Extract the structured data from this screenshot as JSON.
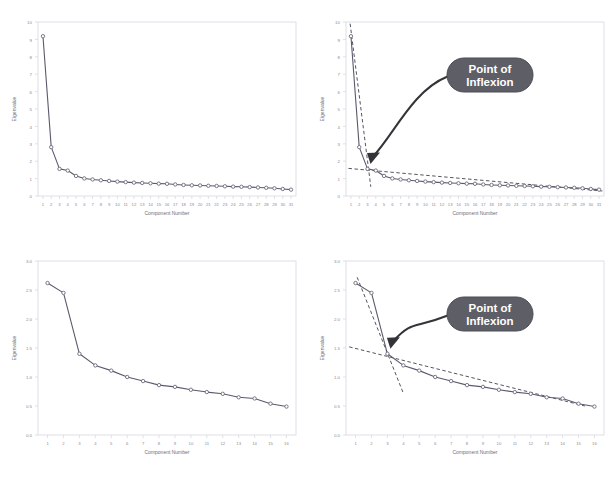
{
  "figure": {
    "kind": "scree-plot-figure",
    "panel_count": 4,
    "background_color": "#ffffff",
    "line_color": "#5a5a6e",
    "marker_color": "#6b6b7d",
    "frame_color": "#d8d8e0",
    "tick_label_color": "#8a8a96",
    "axis_title_color": "#6e6e7a",
    "dashed_line_color": "#555560",
    "callout_fill": "#5e5e66",
    "callout_text_color": "#ffffff",
    "arrow_color": "#333338"
  },
  "callout": {
    "line1": "Point of",
    "line2": "Inflexion",
    "full_text": "Point of Inflexion"
  },
  "chart_data": [
    {
      "id": "top-left",
      "type": "line",
      "title": "",
      "xlabel": "Component Number",
      "ylabel": "Eigenvalue",
      "xlim": [
        0.4,
        31.6
      ],
      "ylim": [
        0,
        10.4
      ],
      "grid": false,
      "legend": "none",
      "annotations": [],
      "x_tick_labels": [
        "1",
        "2",
        "3",
        "4",
        "5",
        "6",
        "7",
        "8",
        "9",
        "10",
        "11",
        "12",
        "13",
        "14",
        "15",
        "16",
        "17",
        "18",
        "19",
        "20",
        "21",
        "22",
        "23",
        "24",
        "25",
        "26",
        "27",
        "28",
        "29",
        "30",
        "31"
      ],
      "y_tick_labels": [
        "0",
        "1",
        "2",
        "3",
        "4",
        "5",
        "6",
        "7",
        "8",
        "9",
        "10"
      ],
      "categories": [
        1,
        2,
        3,
        4,
        5,
        6,
        7,
        8,
        9,
        10,
        11,
        12,
        13,
        14,
        15,
        16,
        17,
        18,
        19,
        20,
        21,
        22,
        23,
        24,
        25,
        26,
        27,
        28,
        29,
        30,
        31
      ],
      "values": [
        9.55,
        2.92,
        1.62,
        1.52,
        1.2,
        1.05,
        0.99,
        0.94,
        0.9,
        0.86,
        0.83,
        0.8,
        0.78,
        0.76,
        0.74,
        0.73,
        0.69,
        0.66,
        0.64,
        0.63,
        0.61,
        0.6,
        0.58,
        0.56,
        0.55,
        0.53,
        0.51,
        0.49,
        0.46,
        0.42,
        0.38
      ]
    },
    {
      "id": "top-right",
      "type": "line",
      "title": "",
      "xlabel": "Component Number",
      "ylabel": "Eigenvalue",
      "xlim": [
        0.4,
        31.6
      ],
      "ylim": [
        0,
        10.4
      ],
      "grid": false,
      "legend": "none",
      "x_tick_labels": [
        "1",
        "2",
        "3",
        "4",
        "5",
        "6",
        "7",
        "8",
        "9",
        "10",
        "11",
        "12",
        "13",
        "14",
        "15",
        "16",
        "17",
        "18",
        "19",
        "20",
        "21",
        "22",
        "23",
        "24",
        "25",
        "26",
        "27",
        "28",
        "29",
        "30",
        "31"
      ],
      "y_tick_labels": [
        "0",
        "1",
        "2",
        "3",
        "4",
        "5",
        "6",
        "7",
        "8",
        "9",
        "10"
      ],
      "categories": [
        1,
        2,
        3,
        4,
        5,
        6,
        7,
        8,
        9,
        10,
        11,
        12,
        13,
        14,
        15,
        16,
        17,
        18,
        19,
        20,
        21,
        22,
        23,
        24,
        25,
        26,
        27,
        28,
        29,
        30,
        31
      ],
      "values": [
        9.55,
        2.92,
        1.62,
        1.52,
        1.2,
        1.05,
        0.99,
        0.94,
        0.9,
        0.86,
        0.83,
        0.8,
        0.78,
        0.76,
        0.74,
        0.73,
        0.69,
        0.66,
        0.64,
        0.63,
        0.61,
        0.6,
        0.58,
        0.56,
        0.55,
        0.53,
        0.51,
        0.49,
        0.46,
        0.42,
        0.38
      ],
      "annotations": [
        {
          "kind": "callout",
          "text": "Point of Inflexion",
          "points_to_component": 3
        },
        {
          "kind": "dashed-trend-steep",
          "from": [
            0.9,
            10.3
          ],
          "to": [
            3.4,
            0.55
          ]
        },
        {
          "kind": "dashed-trend-shallow",
          "from": [
            0.7,
            1.65
          ],
          "to": [
            31.4,
            0.3
          ]
        }
      ]
    },
    {
      "id": "bottom-left",
      "type": "line",
      "title": "",
      "xlabel": "Component Number",
      "ylabel": "Eigenvalue",
      "xlim": [
        0.4,
        16.6
      ],
      "ylim": [
        0.0,
        3.0
      ],
      "grid": false,
      "legend": "none",
      "annotations": [],
      "x_tick_labels": [
        "1",
        "2",
        "3",
        "4",
        "5",
        "6",
        "7",
        "8",
        "9",
        "10",
        "11",
        "12",
        "13",
        "14",
        "15",
        "16"
      ],
      "y_tick_labels": [
        "0.0",
        "0.5",
        "1.0",
        "1.5",
        "2.0",
        "2.5",
        "3.0"
      ],
      "categories": [
        1,
        2,
        3,
        4,
        5,
        6,
        7,
        8,
        9,
        10,
        11,
        12,
        13,
        14,
        15,
        16
      ],
      "values": [
        2.62,
        2.45,
        1.4,
        1.2,
        1.11,
        1.0,
        0.93,
        0.86,
        0.83,
        0.78,
        0.74,
        0.71,
        0.65,
        0.63,
        0.54,
        0.49
      ]
    },
    {
      "id": "bottom-right",
      "type": "line",
      "title": "",
      "xlabel": "Component Number",
      "ylabel": "Eigenvalue",
      "xlim": [
        0.4,
        16.6
      ],
      "ylim": [
        0.0,
        3.0
      ],
      "grid": false,
      "legend": "none",
      "x_tick_labels": [
        "1",
        "2",
        "3",
        "4",
        "5",
        "6",
        "7",
        "8",
        "9",
        "10",
        "11",
        "12",
        "13",
        "14",
        "15",
        "16"
      ],
      "y_tick_labels": [
        "0.0",
        "0.5",
        "1.0",
        "1.5",
        "2.0",
        "2.5",
        "3.0"
      ],
      "categories": [
        1,
        2,
        3,
        4,
        5,
        6,
        7,
        8,
        9,
        10,
        11,
        12,
        13,
        14,
        15,
        16
      ],
      "values": [
        2.62,
        2.45,
        1.4,
        1.2,
        1.11,
        1.0,
        0.93,
        0.86,
        0.83,
        0.78,
        0.74,
        0.71,
        0.65,
        0.63,
        0.54,
        0.49
      ],
      "annotations": [
        {
          "kind": "callout",
          "text": "Point of Inflexion",
          "points_to_component": 3
        },
        {
          "kind": "dashed-trend-steep",
          "from": [
            1.1,
            2.72
          ],
          "to": [
            4.0,
            0.72
          ]
        },
        {
          "kind": "dashed-trend-shallow",
          "from": [
            0.6,
            1.52
          ],
          "to": [
            15.4,
            0.5
          ]
        }
      ]
    }
  ]
}
